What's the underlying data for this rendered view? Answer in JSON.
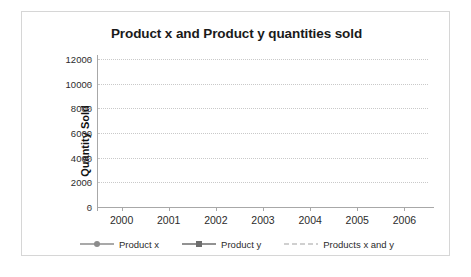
{
  "chart_data": {
    "type": "line",
    "title": "Product x and Product y quantities sold",
    "xlabel": "",
    "ylabel": "Quantity Sold",
    "categories": [
      "2000",
      "2001",
      "2002",
      "2003",
      "2004",
      "2005",
      "2006"
    ],
    "series": [
      {
        "name": "Product x",
        "marker": "circle",
        "linestyle": "solid",
        "color": "#8c8c8c",
        "values": [
          3100,
          3300,
          3800,
          4350,
          4850,
          5450,
          6200
        ]
      },
      {
        "name": "Product y",
        "marker": "square",
        "linestyle": "solid",
        "color": "#6e6e6e",
        "values": [
          6050,
          6100,
          5600,
          5300,
          5150,
          5200,
          4600
        ]
      },
      {
        "name": "Products x and y",
        "marker": "none",
        "linestyle": "dashed",
        "color": "#d0d0d0",
        "values": [
          9150,
          9400,
          9400,
          9650,
          10000,
          10550,
          10700
        ]
      }
    ],
    "ylim": [
      0,
      12000
    ],
    "yticks": [
      "0",
      "2000",
      "4000",
      "6000",
      "8000",
      "10000",
      "12000"
    ],
    "ytick_values": [
      0,
      2000,
      4000,
      6000,
      8000,
      10000,
      12000
    ],
    "grid": true,
    "grid_style": "dotted-horizontal",
    "legend_position": "bottom",
    "legend": [
      "Product x",
      "Product y",
      "Products x and y"
    ]
  },
  "frame": {
    "background": "#ffffff",
    "border_color": "#d6d6d6"
  }
}
